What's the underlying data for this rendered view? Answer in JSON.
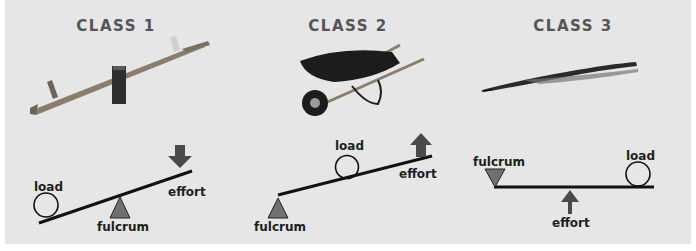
{
  "panels": [
    {
      "title": "CLASS 1",
      "example": "seesaw",
      "labels": {
        "load": "load",
        "effort": "effort",
        "fulcrum": "fulcrum"
      }
    },
    {
      "title": "CLASS 2",
      "example": "wheelbarrow",
      "labels": {
        "load": "load",
        "effort": "effort",
        "fulcrum": "fulcrum"
      }
    },
    {
      "title": "CLASS 3",
      "example": "tweezers",
      "labels": {
        "load": "load",
        "effort": "effort",
        "fulcrum": "fulcrum"
      }
    }
  ],
  "colors": {
    "background": "#e6e6e6",
    "title": "#555555",
    "lever": "#111111",
    "symbol": "#6b6b6b"
  }
}
